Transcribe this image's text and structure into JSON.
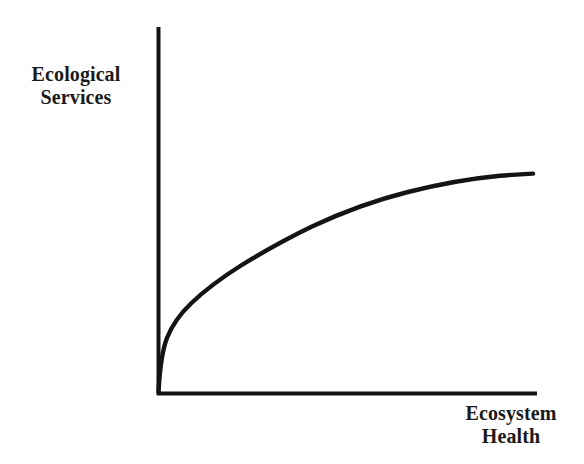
{
  "figure": {
    "background_color": "#ffffff",
    "ink_color": "#141414"
  },
  "axes": {
    "y_axis_label_line1": "Ecological",
    "y_axis_label_line2": "Services",
    "x_axis_label_line1": "Ecosystem",
    "x_axis_label_line2": "Health",
    "tick_labels": [],
    "grid": "off"
  },
  "chart_data": {
    "type": "line",
    "title": "",
    "subtitle": "",
    "xlabel": "Ecosystem Health",
    "ylabel": "Ecological Services",
    "xlim": [
      0,
      1
    ],
    "ylim": [
      0,
      1
    ],
    "grid": false,
    "legend": null,
    "axis_tick_labels": {
      "x": [],
      "y": []
    },
    "annotations": [],
    "series": [
      {
        "name": "Ecological services vs ecosystem health",
        "shape": "concave-increasing-saturating",
        "line_color": "#141414",
        "line_width_px": 4,
        "x": [
          0.0,
          0.02,
          0.04,
          0.07,
          0.11,
          0.16,
          0.22,
          0.32,
          0.42,
          0.52,
          0.64,
          0.76,
          0.88,
          1.0
        ],
        "y": [
          0.0,
          0.14,
          0.2,
          0.27,
          0.33,
          0.38,
          0.45,
          0.53,
          0.6,
          0.66,
          0.72,
          0.77,
          0.81,
          0.84
        ]
      }
    ]
  },
  "geometry": {
    "origin_x": 157,
    "origin_y": 393,
    "y_axis_top": 27,
    "x_axis_right": 537,
    "axis_stroke_width": 4,
    "curve_stroke_width": 4.4,
    "curve_path": "M 158.5 392 C 159.6 372 161.5 352 167 338 C 172.5 324 181 313 191 303.5 C 205 290 222 277.5 241 265.5 C 263 252 286 239 312 226.5 C 344 211.5 376 200 408 192 C 440 184 472 178.5 500 175.8 C 513 174.6 524 174.0 533 173.6"
  }
}
